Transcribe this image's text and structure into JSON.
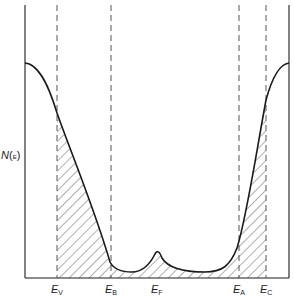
{
  "diagram": {
    "type": "density-of-states",
    "y_axis_label": {
      "main": "N",
      "open": "(",
      "sub": "E",
      "close": ")"
    },
    "energy_markers": [
      {
        "id": "EV",
        "symbol": "E",
        "subscript": "V",
        "x": 57
      },
      {
        "id": "EB",
        "symbol": "E",
        "subscript": "B",
        "x": 111
      },
      {
        "id": "EF",
        "symbol": "E",
        "subscript": "F",
        "x": 157
      },
      {
        "id": "EA",
        "symbol": "E",
        "subscript": "A",
        "x": 239
      },
      {
        "id": "EC",
        "symbol": "E",
        "subscript": "C",
        "x": 266
      }
    ],
    "shaded_regions": [
      "localized states between E_V and E_A (hatched tails)"
    ],
    "colors": {
      "line": "#1a1a1a",
      "dashed": "#555555",
      "hatch": "#333333",
      "background": "#ffffff"
    }
  }
}
